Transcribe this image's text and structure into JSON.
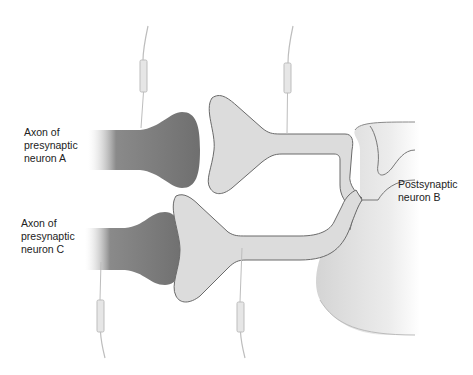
{
  "labels": {
    "axon_a": "Axon of\npresynaptic\nneuron A",
    "axon_c": "Axon of\npresynaptic\nneuron C",
    "neuron_b": "Postsynaptic\nneuron B"
  },
  "colors": {
    "axon_fill": "#7a7a7a",
    "dendrite_fill": "#dcdcdc",
    "soma_fill": "#e8e8e8",
    "outline": "#6a6a6a",
    "electrode": "#bdbdbd"
  },
  "electrodes": [
    {
      "id": "electrode-axon-a",
      "x": 143,
      "direction": "top"
    },
    {
      "id": "electrode-interneuron-top",
      "x": 287,
      "direction": "top"
    },
    {
      "id": "electrode-axon-c",
      "x": 100,
      "direction": "bottom"
    },
    {
      "id": "electrode-interneuron-bottom",
      "x": 243,
      "direction": "bottom"
    }
  ]
}
